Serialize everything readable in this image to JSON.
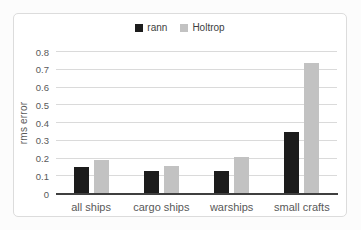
{
  "figure": {
    "background": "#ffffff",
    "frame_border_color": "#dcdcdc"
  },
  "chart_data": {
    "type": "bar",
    "title": "",
    "categories": [
      "all ships",
      "cargo ships",
      "warships",
      "small crafts"
    ],
    "series": [
      {
        "name": "rann",
        "color": "#1c1c1c",
        "values": [
          0.15,
          0.13,
          0.13,
          0.35
        ]
      },
      {
        "name": "Holtrop",
        "color": "#c2c2c2",
        "values": [
          0.19,
          0.16,
          0.21,
          0.74
        ]
      }
    ],
    "xlabel": "",
    "ylabel": "rms error",
    "ylim": [
      0,
      0.8
    ],
    "ytick_step": 0.1,
    "ytick_labels": [
      "0",
      "0.1",
      "0.2",
      "0.3",
      "0.4",
      "0.5",
      "0.6",
      "0.7",
      "0.8"
    ],
    "grid": true,
    "gridline_color": "#dadada",
    "axis_line_color": "#3f3f3f",
    "text_color": "#595959",
    "legend_position": "top"
  }
}
